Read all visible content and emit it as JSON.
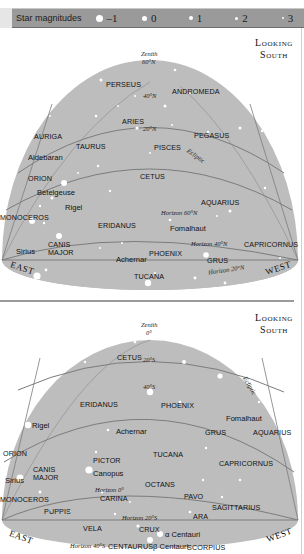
{
  "legend": {
    "title": "Star magnitudes",
    "magnitudes": [
      {
        "label": "–1",
        "size": 8
      },
      {
        "label": "0",
        "size": 6
      },
      {
        "label": "1",
        "size": 4
      },
      {
        "label": "2",
        "size": 3
      },
      {
        "label": "3",
        "size": 2
      }
    ]
  },
  "colors": {
    "sky": "#bdbdbd",
    "lines": "#7c7c7c",
    "stars": "#ffffff",
    "legend_bg": "#9a9a9a"
  },
  "top_panel": {
    "heading_line1": "Looking",
    "heading_line2": "South",
    "zenith": "Zenith",
    "zenith_lat": "60°N",
    "lat_40": "40°N",
    "lat_20": "20°N",
    "ecliptic": "Ecliptic",
    "horizon_60": "Horizon 60°N",
    "horizon_40": "Horizon 40°N",
    "horizon_20": "Horizon 20°N",
    "east": "EAST",
    "west": "WEST",
    "constellations": {
      "perseus": "PERSEUS",
      "andromeda": "ANDROMEDA",
      "aries": "ARIES",
      "pegasus": "PEGASUS",
      "auriga": "AURIGA",
      "taurus": "TAURUS",
      "pisces": "PISCES",
      "orion": "ORION",
      "cetus": "CETUS",
      "aquarius": "AQUARIUS",
      "monoceros": "MONOCEROS",
      "eridanus": "ERIDANUS",
      "canis_major_1": "CANIS",
      "canis_major_2": "MAJOR",
      "phoenix": "PHOENIX",
      "capricornus": "CAPRICORNUS",
      "grus": "GRUS",
      "tucana": "TUCANA"
    },
    "stars": {
      "aldebaran": "Aldebaran",
      "betelgeuse": "Betelgeuse",
      "rigel": "Rigel",
      "sirius": "Sirius",
      "fomalhaut": "Fomalhaut",
      "achernar": "Achernar"
    }
  },
  "bottom_panel": {
    "heading_line1": "Looking",
    "heading_line2": "South",
    "zenith": "Zenith",
    "zenith_lat": "0°",
    "lat_20": "20°S",
    "lat_40": "40°S",
    "ecliptic": "Ecliptic",
    "horizon_0": "Horizon 0°",
    "horizon_20": "Horizon 20°S",
    "horizon_40": "Horizon 40°S",
    "east": "EAST",
    "west": "WEST",
    "constellations": {
      "cetus": "CETUS",
      "eridanus": "ERIDANUS",
      "phoenix": "PHOENIX",
      "grus": "GRUS",
      "aquarius": "AQUARIUS",
      "orion": "ORION",
      "tucana": "TUCANA",
      "pictor": "PICTOR",
      "capricornus": "CAPRICORNUS",
      "canis_major_1": "CANIS",
      "canis_major_2": "MAJOR",
      "octans": "OCTANS",
      "carina": "CARINA",
      "pavo": "PAVO",
      "monoceros": "MONOCEROS",
      "sagittarius": "SAGITTARIUS",
      "puppis": "PUPPIS",
      "ara": "ARA",
      "vela": "VELA",
      "crux": "CRUX",
      "centaurus": "CENTAURUS",
      "scorpius": "SCORPIUS"
    },
    "stars": {
      "rigel": "Rigel",
      "achernar": "Achernar",
      "fomalhaut": "Fomalhaut",
      "canopus": "Canopus",
      "sirius": "Sirius",
      "alpha_centauri": "α Centauri",
      "beta_centauri": "β Centauri"
    }
  }
}
